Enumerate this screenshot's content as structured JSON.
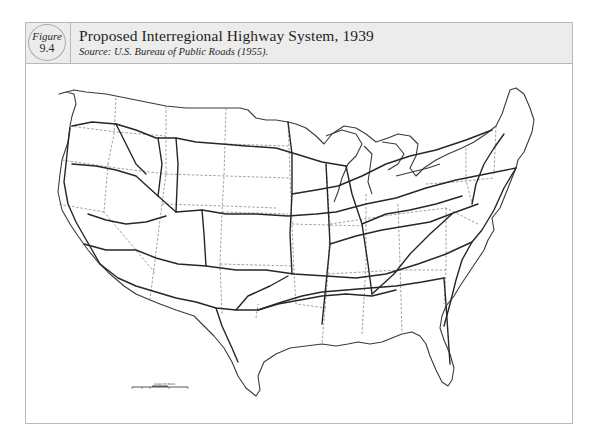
{
  "figure": {
    "badge_word": "Figure",
    "badge_number": "9.4",
    "title": "Proposed Interregional Highway System, 1939",
    "source": "Source: U.S. Bureau of Public Roads (1955)."
  },
  "map": {
    "subject": "Contiguous United States with proposed interregional highway routes",
    "layers": [
      {
        "name": "national-outline",
        "style": "solid",
        "color": "#3a3a3a"
      },
      {
        "name": "state-boundaries",
        "style": "dashed",
        "color": "#6a6a6a"
      },
      {
        "name": "highway-routes",
        "style": "solid-bold",
        "color": "#2a2a2a"
      }
    ],
    "scale_bar": {
      "title": "SCALE OF MILES",
      "ticks": [
        "100",
        "50",
        "0",
        "100",
        "200",
        "300"
      ]
    }
  },
  "colors": {
    "header_bg": "#ececec",
    "border": "#b9b9b9",
    "ink": "#2a2a2a"
  }
}
